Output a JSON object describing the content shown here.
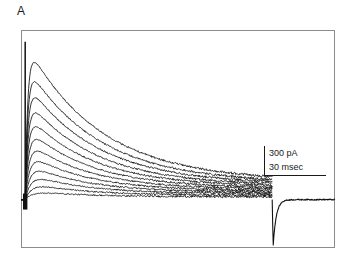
{
  "panel": {
    "label": "A"
  },
  "scalebar": {
    "current_label": "300 pA",
    "time_label": "30 msec",
    "current_value": 300,
    "current_unit": "pA",
    "time_value": 30,
    "time_unit": "msec"
  },
  "colors": {
    "trace": "#111111",
    "frame": "#8c8c8c",
    "background": "#ffffff",
    "text": "#1a1a1a"
  },
  "chart_data": {
    "type": "line",
    "title": "",
    "subtitle": "",
    "xlabel": "",
    "ylabel": "",
    "legend": [],
    "grid": false,
    "axes_visible": false,
    "frame": "box",
    "x_units": "msec",
    "y_units": "pA",
    "xlim": [
      0,
      300
    ],
    "ylim": [
      -420,
      1500
    ],
    "pulse_onset_ms": 4,
    "pulse_offset_ms": 240,
    "baseline_pa": 0,
    "n_traces": 12,
    "annotations": [
      {
        "text": "300 pA",
        "kind": "scalebar-vertical"
      },
      {
        "text": "30 msec",
        "kind": "scalebar-horizontal"
      }
    ],
    "series": [
      {
        "name": "step 1",
        "peak_pa": 1430,
        "plateau_pa": 165,
        "tau_ms": 70,
        "rise_ms": 2.5
      },
      {
        "name": "step 2",
        "peak_pa": 1235,
        "plateau_pa": 150,
        "tau_ms": 68,
        "rise_ms": 2.6
      },
      {
        "name": "step 3",
        "peak_pa": 1080,
        "plateau_pa": 138,
        "tau_ms": 66,
        "rise_ms": 2.8
      },
      {
        "name": "step 4",
        "peak_pa": 930,
        "plateau_pa": 126,
        "tau_ms": 64,
        "rise_ms": 3.0
      },
      {
        "name": "step 5",
        "peak_pa": 790,
        "plateau_pa": 114,
        "tau_ms": 62,
        "rise_ms": 3.2
      },
      {
        "name": "step 6",
        "peak_pa": 665,
        "plateau_pa": 102,
        "tau_ms": 60,
        "rise_ms": 3.5
      },
      {
        "name": "step 7",
        "peak_pa": 545,
        "plateau_pa": 90,
        "tau_ms": 58,
        "rise_ms": 3.9
      },
      {
        "name": "step 8",
        "peak_pa": 435,
        "plateau_pa": 78,
        "tau_ms": 56,
        "rise_ms": 4.4
      },
      {
        "name": "step 9",
        "peak_pa": 335,
        "plateau_pa": 66,
        "tau_ms": 54,
        "rise_ms": 5.0
      },
      {
        "name": "step 10",
        "peak_pa": 245,
        "plateau_pa": 54,
        "tau_ms": 52,
        "rise_ms": 5.8
      },
      {
        "name": "step 11",
        "peak_pa": 160,
        "plateau_pa": 40,
        "tau_ms": 50,
        "rise_ms": 6.8
      },
      {
        "name": "step 12",
        "peak_pa": 85,
        "plateau_pa": 26,
        "tau_ms": 48,
        "rise_ms": 8.0
      }
    ],
    "tail": {
      "name": "offset transient",
      "min_pa": -420,
      "recovery_tau_ms": 3,
      "post_pulse_baseline_pa": 0
    },
    "noise_amplitude_pa": 18
  }
}
